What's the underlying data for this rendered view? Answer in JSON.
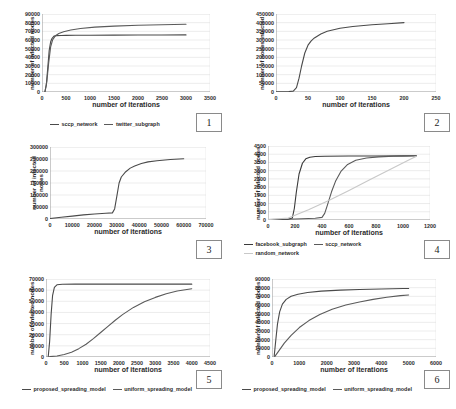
{
  "figure": {
    "panel_count": 6,
    "line_colors": {
      "dark": "#4a4a4a",
      "darker": "#3a3a3a",
      "light": "#c8c8c8",
      "grid": "#d9d9d9",
      "axis": "#8a8a8a",
      "text": "#2b2b2b"
    }
  },
  "charts": [
    {
      "badge": "1",
      "chart_data": {
        "type": "line",
        "title": "",
        "xlabel": "number of iterations",
        "ylabel": "number of infected nodes",
        "xlim": [
          0,
          3500
        ],
        "ylim": [
          0,
          90000
        ],
        "xticks": [
          0,
          500,
          1000,
          1500,
          2000,
          2500,
          3000,
          3500
        ],
        "yticks": [
          0,
          10000,
          20000,
          30000,
          40000,
          50000,
          60000,
          70000,
          80000,
          90000
        ],
        "grid": true,
        "legend_position": "bottom",
        "series": [
          {
            "name": "sccp_network",
            "color": "#4a4a4a",
            "x": [
              60,
              90,
              120,
              150,
              180,
              210,
              250,
              300,
              400,
              500,
              700,
              1000,
              1500,
              2000,
              2500,
              3000
            ],
            "y": [
              0,
              8000,
              28000,
              48000,
              58000,
              62000,
              64500,
              65000,
              65200,
              65300,
              65400,
              65500,
              65600,
              65700,
              65800,
              65900
            ]
          },
          {
            "name": "twitter_subgraph",
            "color": "#5a5a5a",
            "x": [
              60,
              100,
              140,
              180,
              220,
              280,
              350,
              450,
              600,
              800,
              1100,
              1500,
              2000,
              2500,
              3000
            ],
            "y": [
              0,
              12000,
              34000,
              52000,
              60000,
              65000,
              67500,
              69500,
              71500,
              73200,
              74800,
              76000,
              77000,
              77600,
              78200
            ]
          }
        ]
      }
    },
    {
      "badge": "2",
      "chart_data": {
        "type": "line",
        "title": "",
        "xlabel": "number of iterations",
        "ylabel": "number of nodes infected",
        "xlim": [
          0,
          250
        ],
        "ylim": [
          0,
          450000
        ],
        "xticks": [
          0,
          50,
          100,
          150,
          200,
          250
        ],
        "yticks": [
          0,
          50000,
          100000,
          150000,
          200000,
          250000,
          300000,
          350000,
          400000,
          450000
        ],
        "grid": true,
        "legend_position": "none",
        "series": [
          {
            "name": "infection_curve",
            "color": "#4a4a4a",
            "x": [
              0,
              10,
              20,
              27,
              32,
              36,
              40,
              45,
              50,
              55,
              60,
              70,
              80,
              100,
              120,
              150,
              175,
              200
            ],
            "y": [
              1000,
              1500,
              2500,
              5000,
              25000,
              80000,
              150000,
              225000,
              270000,
              295000,
              312000,
              335000,
              350000,
              368000,
              378000,
              388000,
              394000,
              400000
            ]
          }
        ]
      }
    },
    {
      "badge": "3",
      "chart_data": {
        "type": "line",
        "title": "",
        "xlabel": "number of iterations",
        "ylabel": "number of infected nodes",
        "xlim": [
          0,
          70000
        ],
        "ylim": [
          0,
          300000
        ],
        "xticks": [
          0,
          10000,
          20000,
          30000,
          40000,
          50000,
          60000,
          70000
        ],
        "yticks": [
          0,
          50000,
          100000,
          150000,
          200000,
          250000,
          300000
        ],
        "grid": true,
        "legend_position": "none",
        "series": [
          {
            "name": "infection_curve",
            "color": "#4a4a4a",
            "x": [
              0,
              5000,
              10000,
              15000,
              20000,
              25000,
              28000,
              29000,
              30000,
              31000,
              32000,
              34000,
              36000,
              38000,
              41000,
              44000,
              48000,
              54000,
              60000
            ],
            "y": [
              2000,
              7000,
              12000,
              17000,
              21000,
              24000,
              25500,
              42000,
              95000,
              150000,
              175000,
              197000,
              212000,
              221000,
              231000,
              238000,
              243000,
              248000,
              251000
            ]
          }
        ]
      }
    },
    {
      "badge": "4",
      "chart_data": {
        "type": "line",
        "title": "",
        "xlabel": "number of iterations",
        "ylabel": "number of infected nodes",
        "xlim": [
          0,
          1200
        ],
        "ylim": [
          0,
          4500
        ],
        "xticks": [
          0,
          200,
          400,
          600,
          800,
          1000,
          1200
        ],
        "yticks": [
          0,
          500,
          1000,
          1500,
          2000,
          2500,
          3000,
          3500,
          4000,
          4500
        ],
        "grid": true,
        "legend_position": "bottom",
        "series": [
          {
            "name": "facebook_subgraph",
            "color": "#3a3a3a",
            "x": [
              0,
              150,
              180,
              195,
              210,
              230,
              255,
              280,
              310,
              350,
              420,
              600,
              800,
              1000,
              1100
            ],
            "y": [
              30,
              40,
              120,
              700,
              1700,
              2800,
              3450,
              3720,
              3820,
              3860,
              3880,
              3890,
              3895,
              3900,
              3905
            ]
          },
          {
            "name": "sccp_network",
            "color": "#5a5a5a",
            "x": [
              0,
              200,
              350,
              400,
              420,
              440,
              470,
              500,
              540,
              590,
              650,
              730,
              820,
              930,
              1050,
              1100
            ],
            "y": [
              30,
              60,
              110,
              160,
              400,
              900,
              1700,
              2350,
              2950,
              3380,
              3630,
              3770,
              3840,
              3875,
              3895,
              3905
            ]
          },
          {
            "name": "random_network",
            "color": "#c8c8c8",
            "x": [
              0,
              150,
              300,
              450,
              600,
              750,
              900,
              1050,
              1100
            ],
            "y": [
              20,
              120,
              620,
              1180,
              1800,
              2430,
              3050,
              3680,
              3880
            ]
          }
        ]
      }
    },
    {
      "badge": "5",
      "chart_data": {
        "type": "line",
        "title": "",
        "xlabel": "number of iterations",
        "ylabel": "number of infected nodes",
        "xlim": [
          0,
          4500
        ],
        "ylim": [
          0,
          70000
        ],
        "xticks": [
          0,
          500,
          1000,
          1500,
          2000,
          2500,
          3000,
          3500,
          4000,
          4500
        ],
        "yticks": [
          0,
          10000,
          20000,
          30000,
          40000,
          50000,
          60000,
          70000
        ],
        "grid": true,
        "legend_position": "bottom",
        "series": [
          {
            "name": "proposed_spreading_model",
            "color": "#4a4a4a",
            "x": [
              60,
              100,
              140,
              180,
              230,
              300,
              450,
              800,
              1500,
              2500,
              3500,
              4000
            ],
            "y": [
              0,
              14000,
              38000,
              55000,
              62500,
              64800,
              65300,
              65400,
              65400,
              65400,
              65400,
              65400
            ]
          },
          {
            "name": "uniform_spreading_model",
            "color": "#5a5a5a",
            "x": [
              100,
              300,
              500,
              700,
              900,
              1100,
              1300,
              1500,
              1700,
              1900,
              2100,
              2400,
              2700,
              3000,
              3300,
              3600,
              4000
            ],
            "y": [
              300,
              900,
              2200,
              4300,
              7500,
              11500,
              16500,
              22000,
              27500,
              33000,
              38000,
              44500,
              49500,
              53500,
              56800,
              59200,
              61200
            ]
          }
        ]
      }
    },
    {
      "badge": "6",
      "chart_data": {
        "type": "line",
        "title": "",
        "xlabel": "number of iterations",
        "ylabel": "number of infected nodes",
        "xlim": [
          0,
          6000
        ],
        "ylim": [
          0,
          90000
        ],
        "xticks": [
          0,
          1000,
          2000,
          3000,
          4000,
          5000,
          6000
        ],
        "yticks": [
          0,
          10000,
          20000,
          30000,
          40000,
          50000,
          60000,
          70000,
          80000,
          90000
        ],
        "grid": true,
        "legend_position": "bottom",
        "series": [
          {
            "name": "proposed_spreading_model",
            "color": "#4a4a4a",
            "x": [
              80,
              140,
              200,
              280,
              380,
              520,
              700,
              950,
              1300,
              1800,
              2500,
              3200,
              4000,
              4800,
              5000
            ],
            "y": [
              1000,
              20000,
              38000,
              52000,
              61000,
              66500,
              70000,
              72500,
              74400,
              76000,
              77200,
              77900,
              78500,
              79000,
              79100
            ]
          },
          {
            "name": "uniform_spreading_model",
            "color": "#5a5a5a",
            "x": [
              100,
              250,
              450,
              700,
              1000,
              1350,
              1750,
              2200,
              2700,
              3200,
              3700,
              4200,
              4700,
              5000
            ],
            "y": [
              500,
              7000,
              16000,
              25000,
              34000,
              42000,
              49000,
              55000,
              60000,
              63500,
              66500,
              69000,
              70800,
              71600
            ]
          }
        ]
      }
    }
  ]
}
